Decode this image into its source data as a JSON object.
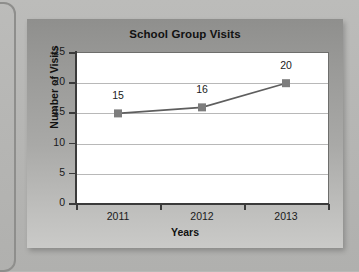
{
  "chart_data": {
    "type": "line",
    "title": "School Group Visits",
    "xlabel": "Years",
    "ylabel": "Number of Visits",
    "categories": [
      "2011",
      "2012",
      "2013"
    ],
    "values": [
      15,
      16,
      20
    ],
    "point_labels": [
      "15",
      "16",
      "20"
    ],
    "ylim": [
      0,
      25
    ],
    "yticks": [
      "0",
      "5",
      "10",
      "15",
      "20",
      "25"
    ],
    "ytick_values": [
      0,
      5,
      10,
      15,
      20,
      25
    ],
    "grid": "horizontal",
    "legend": "none",
    "marker": "square",
    "colors": {
      "line": "#5e5e5e",
      "marker": "#7d7d7d",
      "plot_background": "#ffffff",
      "panel_background": "#a3a3a1",
      "gridline": "#b8b8b8",
      "axis": "#3b3b3b",
      "text": "#1a1a1a"
    }
  }
}
